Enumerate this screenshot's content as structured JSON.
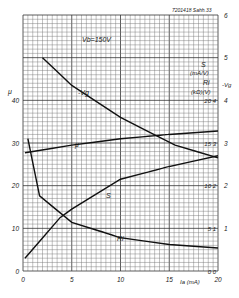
{
  "header": {
    "code": "7201418  Sahh.33"
  },
  "chart_data": {
    "type": "line",
    "title": "",
    "annotation": "Vb=150V",
    "xlabel": "Ia (mA)",
    "xlim": [
      0,
      20
    ],
    "x_ticks": [
      "0",
      "5",
      "10",
      "15",
      "20"
    ],
    "left_axis": {
      "label": "μ",
      "ylim": [
        0,
        60
      ],
      "ticks": [
        "0",
        "10",
        "20",
        "30",
        "40"
      ]
    },
    "right_axis_outer": {
      "label": "S (mA/V)",
      "ylim": [
        0,
        6
      ],
      "ticks": [
        "0",
        "1",
        "2",
        "3",
        "4",
        "5",
        "6"
      ]
    },
    "right_axis_inner": {
      "label": "Ri (kΩ) | -Vg (V)",
      "ticks": [
        "0|0",
        "5|1",
        "10|2",
        "15|3",
        "20|4"
      ]
    },
    "grid": true,
    "series": [
      {
        "name": "-Vg",
        "axis": "V",
        "x": [
          2,
          5,
          10,
          15.6,
          20
        ],
        "values": [
          5.0,
          4.35,
          3.6,
          2.95,
          2.65
        ]
      },
      {
        "name": "μ",
        "axis": "μ",
        "x": [
          0.2,
          5,
          10,
          15,
          20
        ],
        "values": [
          27.7,
          29.5,
          31.0,
          32.0,
          32.8
        ]
      },
      {
        "name": "S",
        "axis": "S (mA/V)",
        "x": [
          0.2,
          3.8,
          5,
          10,
          15,
          20
        ],
        "values": [
          0.3,
          1.25,
          1.45,
          2.15,
          2.45,
          2.7
        ]
      },
      {
        "name": "Ri",
        "axis": "Ri (kΩ)",
        "x": [
          0.5,
          1.7,
          5,
          10,
          15,
          20
        ],
        "values": [
          15.5,
          8.8,
          5.7,
          3.9,
          3.1,
          2.7
        ]
      }
    ]
  },
  "labels": {
    "vb": "Vb=150V",
    "vg_curve": "-Vg",
    "mu_curve": "μ",
    "s_curve": "S",
    "ri_curve": "Ri",
    "mu_axis": "μ",
    "s_axis": "S",
    "s_unit": "(mA/V)",
    "ri_axis": "Ri",
    "vg_axis": "-Vg",
    "ri_unit": "(kΩ)(V)",
    "x_axis": "Ia (mA)"
  }
}
